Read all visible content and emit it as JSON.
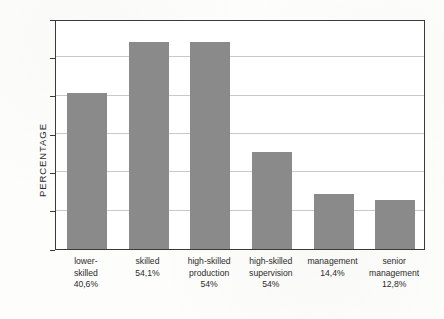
{
  "chart_data": {
    "type": "bar",
    "title": "",
    "xlabel": "",
    "ylabel": "PERCENTAGE",
    "ylim": [
      0,
      60
    ],
    "ytick_step": 10,
    "yticks": [
      "0",
      "10",
      "20",
      "30",
      "40",
      "50",
      "60"
    ],
    "grid": "horizontal",
    "legend": "none",
    "bar_color": "#8a8a8a",
    "categories": [
      "lower-skilled",
      "skilled",
      "high-skilled production",
      "high-skilled supervision",
      "management",
      "senior management"
    ],
    "category_label_lines": [
      [
        "lower-",
        "skilled",
        "40,6%"
      ],
      [
        "skilled",
        "54,1%"
      ],
      [
        "high-skilled",
        "production",
        "54%"
      ],
      [
        "high-skilled",
        "supervision",
        "54%"
      ],
      [
        "management",
        "14,4%"
      ],
      [
        "senior",
        "management",
        "12,8%"
      ]
    ],
    "value_labels": [
      "40,6%",
      "54,1%",
      "54%",
      "54%",
      "14,4%",
      "12,8%"
    ],
    "values": [
      40.6,
      54.1,
      54,
      25.4,
      14.4,
      12.8
    ],
    "plotted_heights": [
      40.6,
      54.1,
      54,
      25.4,
      14.4,
      12.8
    ]
  }
}
